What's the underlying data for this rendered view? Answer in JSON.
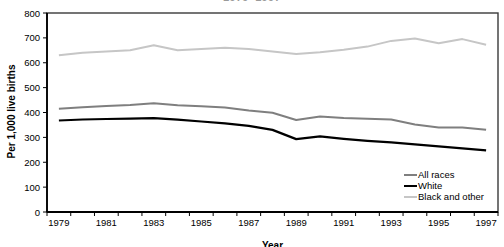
{
  "chart": {
    "title_cropped": "1979–1997",
    "frame_color": "#3a3a3a",
    "axis_color": "#000000",
    "background": "#ffffff"
  },
  "chart_data": {
    "type": "line",
    "title": "1979–1997",
    "xlabel": "Year",
    "ylabel": "Per 1,000 live births",
    "ylim": [
      0,
      800
    ],
    "yticks": [
      0,
      100,
      200,
      300,
      400,
      500,
      600,
      700,
      800
    ],
    "xticks": [
      "1979",
      "1981",
      "1983",
      "1985",
      "1987",
      "1989",
      "1991",
      "1993",
      "1995",
      "1997"
    ],
    "grid": false,
    "legend_position": "inside-lower-right",
    "categories": [
      1979,
      1980,
      1981,
      1982,
      1983,
      1984,
      1985,
      1986,
      1987,
      1988,
      1989,
      1990,
      1991,
      1992,
      1993,
      1994,
      1995,
      1996,
      1997
    ],
    "series": [
      {
        "name": "All races",
        "color": "#7f7f7f",
        "width": 2,
        "values": [
          415,
          421,
          426,
          430,
          437,
          429,
          425,
          420,
          408,
          399,
          370,
          384,
          378,
          375,
          372,
          352,
          340,
          340,
          331
        ]
      },
      {
        "name": "White",
        "color": "#000000",
        "width": 2.2,
        "values": [
          368,
          372,
          374,
          375,
          377,
          371,
          364,
          356,
          346,
          330,
          293,
          304,
          294,
          286,
          280,
          272,
          264,
          256,
          248
        ]
      },
      {
        "name": "Black and other",
        "color": "#c6c6c6",
        "width": 2,
        "values": [
          630,
          640,
          645,
          650,
          670,
          650,
          655,
          660,
          655,
          645,
          635,
          642,
          652,
          665,
          688,
          698,
          678,
          695,
          672
        ]
      }
    ]
  }
}
